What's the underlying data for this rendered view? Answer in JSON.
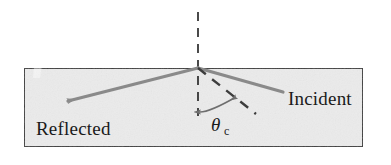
{
  "figure": {
    "background_color": "#ffffff",
    "medium": {
      "name": "optical-medium-block",
      "fill_color": "#ebebeb",
      "border_color": "#3d3d3d",
      "x": 24,
      "y": 68,
      "width": 339,
      "height": 79
    },
    "normal_line": {
      "name": "normal-dashed-line",
      "color": "#2b2b2b",
      "x": 198,
      "y_top": 12,
      "y_bottom": 116
    },
    "incidence_point": {
      "x": 198,
      "y": 68
    },
    "rays": [
      {
        "name": "incident-ray",
        "label": "Incident",
        "style": "solid",
        "color": "#8a8a8a",
        "arrowhead": false,
        "from": {
          "x": 283,
          "y": 92
        },
        "to": {
          "x": 198,
          "y": 68
        },
        "label_x": 288,
        "label_y": 105
      },
      {
        "name": "reflected-ray",
        "label": "Reflected",
        "style": "solid",
        "color": "#8a8a8a",
        "arrowhead": true,
        "from": {
          "x": 198,
          "y": 68
        },
        "to": {
          "x": 62,
          "y": 103
        },
        "label_x": 36,
        "label_y": 135
      },
      {
        "name": "refracted-grazing-ray",
        "label": "",
        "style": "dashed",
        "color": "#3d3d3d",
        "arrowhead": false,
        "from": {
          "x": 198,
          "y": 68
        },
        "to": {
          "x": 256,
          "y": 114
        },
        "label_x": 0,
        "label_y": 0
      }
    ],
    "angle_marker": {
      "name": "critical-angle-arc",
      "symbol": "θ",
      "subscript": "c",
      "full_label": "θc",
      "color": "#6e6e6e",
      "symbol_x": 211,
      "symbol_y": 131,
      "subscript_x": 224,
      "subscript_y": 135,
      "arc_start": {
        "x": 200,
        "y": 112
      },
      "arc_end": {
        "x": 236,
        "y": 97
      },
      "arc_control": {
        "x": 211,
        "y": 112
      }
    },
    "scan_artifact": {
      "name": "scan-light-streak",
      "color": "#f6f6f6",
      "description": "faint diagonal light streak in upper-left of scanned page"
    }
  }
}
